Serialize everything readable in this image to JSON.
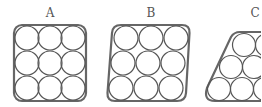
{
  "figure": {
    "panels": [
      {
        "id": "A",
        "label": "A",
        "shape": "rounded-square",
        "arrangement": "square-grid",
        "rows": 3,
        "cols": 3,
        "circle_count": 9
      },
      {
        "id": "B",
        "label": "B",
        "shape": "rounded-parallelogram",
        "arrangement": "sheared-square-grid",
        "rows": 3,
        "cols": 3,
        "circle_count": 9
      },
      {
        "id": "C",
        "label": "C",
        "shape": "rounded-trapezoid",
        "arrangement": "hexagonal",
        "rows": 3,
        "circle_count_visible": 6,
        "cropped": true
      }
    ],
    "colors": {
      "background": "#ffffff",
      "frame_stroke": "#666666",
      "circle_stroke": "#555555",
      "label": "#555555"
    }
  }
}
